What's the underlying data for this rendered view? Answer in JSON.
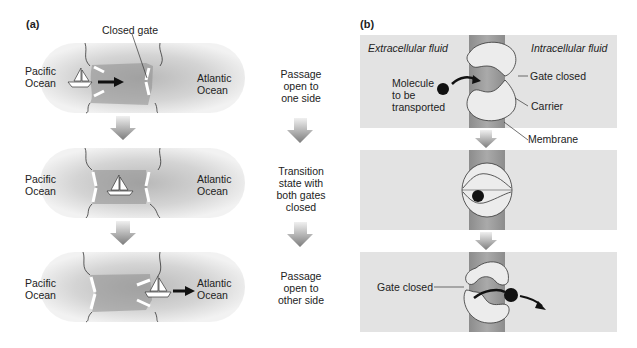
{
  "panel_a": {
    "label": "(a)",
    "callout": "Closed gate",
    "rows": [
      {
        "left": "Pacific Ocean",
        "right": "Atlantic Ocean",
        "state": "Passage open to one side"
      },
      {
        "left": "Pacific Ocean",
        "right": "Atlantic Ocean",
        "state": "Transition state with both gates closed"
      },
      {
        "left": "Pacific Ocean",
        "right": "Atlantic Ocean",
        "state": "Passage open to other side"
      }
    ],
    "left_lines": [
      "Pacific",
      "Ocean"
    ],
    "right_lines": [
      "Atlantic",
      "Ocean"
    ],
    "state_lines": [
      [
        "Passage",
        "open to",
        "one side"
      ],
      [
        "Transition",
        "state with",
        "both gates",
        "closed"
      ],
      [
        "Passage",
        "open to",
        "other side"
      ]
    ]
  },
  "panel_b": {
    "label": "(b)",
    "extracellular": "Extracellular fluid",
    "intracellular": "Intracellular fluid",
    "molecule_lines": [
      "Molecule",
      "to be",
      "transported"
    ],
    "gate_closed_top": "Gate closed",
    "carrier": "Carrier",
    "membrane": "Membrane",
    "gate_closed_bottom": "Gate closed"
  },
  "colors": {
    "water_light": "#e6e6e6",
    "water_dark": "#a9a9a9",
    "channel": "#9a9a9a",
    "arrow_gray": "#858585",
    "fluid_bg": "#e3e3e3",
    "membrane": "#a3a3a3",
    "carrier": "#ececec",
    "molecule": "#111111"
  }
}
